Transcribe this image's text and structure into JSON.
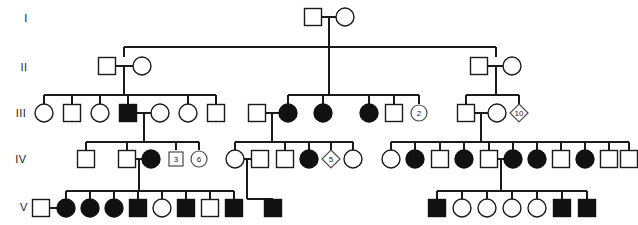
{
  "figure": {
    "type": "pedigree-chart",
    "width": 638,
    "height": 225,
    "background_color": "#ffffff",
    "line_color": "#1a1a1a",
    "affected_color": "#111111",
    "unaffected_color": "#ffffff"
  },
  "generation_labels": [
    {
      "label": "I",
      "x": 26,
      "y": 22
    },
    {
      "label": "II",
      "x": 24,
      "y": 71
    },
    {
      "label": "III",
      "x": 21,
      "y": 117
    },
    {
      "label": "IV",
      "x": 21,
      "y": 163
    },
    {
      "label": "V",
      "x": 24,
      "y": 211
    }
  ],
  "generations": [
    {
      "id": "I",
      "row_y": 17,
      "individuals": [
        {
          "id": "I-1",
          "shape": "square",
          "status": "unaffected",
          "x": 313,
          "label": ""
        },
        {
          "id": "I-2",
          "shape": "circle",
          "status": "unaffected",
          "x": 345,
          "label": ""
        }
      ]
    },
    {
      "id": "II",
      "row_y": 66,
      "individuals": [
        {
          "id": "II-1",
          "shape": "square",
          "status": "unaffected",
          "x": 107,
          "label": ""
        },
        {
          "id": "II-2",
          "shape": "circle",
          "status": "unaffected",
          "x": 142,
          "label": ""
        },
        {
          "id": "II-3",
          "shape": "square",
          "status": "unaffected",
          "x": 479,
          "label": ""
        },
        {
          "id": "II-4",
          "shape": "circle",
          "status": "unaffected",
          "x": 512,
          "label": ""
        }
      ]
    },
    {
      "id": "III",
      "row_y": 113,
      "individuals": [
        {
          "id": "III-1",
          "shape": "circle",
          "status": "unaffected",
          "x": 44,
          "label": ""
        },
        {
          "id": "III-2",
          "shape": "square",
          "status": "unaffected",
          "x": 72,
          "label": ""
        },
        {
          "id": "III-3",
          "shape": "circle",
          "status": "unaffected",
          "x": 100,
          "label": ""
        },
        {
          "id": "III-4",
          "shape": "square",
          "status": "affected",
          "x": 128,
          "label": ""
        },
        {
          "id": "III-5",
          "shape": "circle",
          "status": "unaffected",
          "x": 160,
          "label": ""
        },
        {
          "id": "III-6",
          "shape": "circle",
          "status": "unaffected",
          "x": 188,
          "label": ""
        },
        {
          "id": "III-7",
          "shape": "square",
          "status": "unaffected",
          "x": 216,
          "label": ""
        },
        {
          "id": "III-8",
          "shape": "square",
          "status": "unaffected",
          "x": 257,
          "label": ""
        },
        {
          "id": "III-9",
          "shape": "circle",
          "status": "affected",
          "x": 288,
          "label": ""
        },
        {
          "id": "III-10",
          "shape": "circle",
          "status": "affected",
          "x": 323,
          "label": ""
        },
        {
          "id": "III-11",
          "shape": "circle",
          "status": "affected",
          "x": 369,
          "label": ""
        },
        {
          "id": "III-12",
          "shape": "square",
          "status": "unaffected",
          "x": 394,
          "label": ""
        },
        {
          "id": "III-13",
          "shape": "circle",
          "status": "multiple",
          "x": 419,
          "label": "2"
        },
        {
          "id": "III-14",
          "shape": "square",
          "status": "unaffected",
          "x": 466,
          "label": ""
        },
        {
          "id": "III-15",
          "shape": "circle",
          "status": "unaffected",
          "x": 497,
          "label": ""
        },
        {
          "id": "III-16",
          "shape": "diamond",
          "status": "multiple",
          "x": 519,
          "label": "10"
        }
      ]
    },
    {
      "id": "IV",
      "row_y": 159,
      "individuals": [
        {
          "id": "IV-1",
          "shape": "square",
          "status": "unaffected",
          "x": 86,
          "label": ""
        },
        {
          "id": "IV-2",
          "shape": "square",
          "status": "unaffected",
          "x": 127,
          "label": ""
        },
        {
          "id": "IV-3",
          "shape": "circle",
          "status": "affected",
          "x": 151,
          "label": ""
        },
        {
          "id": "IV-4",
          "shape": "square",
          "status": "multiple",
          "x": 176,
          "label": "3"
        },
        {
          "id": "IV-5",
          "shape": "circle",
          "status": "multiple",
          "x": 199,
          "label": "6"
        },
        {
          "id": "IV-6",
          "shape": "circle",
          "status": "unaffected",
          "x": 235,
          "label": ""
        },
        {
          "id": "IV-7",
          "shape": "square",
          "status": "unaffected",
          "x": 260,
          "label": ""
        },
        {
          "id": "IV-8",
          "shape": "square",
          "status": "unaffected",
          "x": 285,
          "label": ""
        },
        {
          "id": "IV-9",
          "shape": "circle",
          "status": "affected",
          "x": 309,
          "label": ""
        },
        {
          "id": "IV-10",
          "shape": "diamond",
          "status": "multiple",
          "x": 331,
          "label": "5"
        },
        {
          "id": "IV-11",
          "shape": "circle",
          "status": "unaffected",
          "x": 353,
          "label": ""
        },
        {
          "id": "IV-12",
          "shape": "circle",
          "status": "unaffected",
          "x": 391,
          "label": ""
        },
        {
          "id": "IV-13",
          "shape": "circle",
          "status": "affected",
          "x": 415,
          "label": ""
        },
        {
          "id": "IV-14",
          "shape": "square",
          "status": "unaffected",
          "x": 440,
          "label": ""
        },
        {
          "id": "IV-15",
          "shape": "circle",
          "status": "affected",
          "x": 464,
          "label": ""
        },
        {
          "id": "IV-16",
          "shape": "square",
          "status": "unaffected",
          "x": 489,
          "label": ""
        },
        {
          "id": "IV-17",
          "shape": "circle",
          "status": "affected",
          "x": 513,
          "label": ""
        },
        {
          "id": "IV-18",
          "shape": "circle",
          "status": "affected",
          "x": 537,
          "label": ""
        },
        {
          "id": "IV-19",
          "shape": "square",
          "status": "unaffected",
          "x": 561,
          "label": ""
        },
        {
          "id": "IV-20",
          "shape": "circle",
          "status": "affected",
          "x": 585,
          "label": ""
        },
        {
          "id": "IV-21",
          "shape": "square",
          "status": "unaffected",
          "x": 609,
          "label": ""
        },
        {
          "id": "IV-22",
          "shape": "square",
          "status": "unaffected",
          "x": 629,
          "label": ""
        }
      ]
    },
    {
      "id": "V",
      "row_y": 208,
      "individuals": [
        {
          "id": "V-1",
          "shape": "square",
          "status": "unaffected",
          "x": 41,
          "label": ""
        },
        {
          "id": "V-2",
          "shape": "circle",
          "status": "affected",
          "x": 66,
          "label": ""
        },
        {
          "id": "V-3",
          "shape": "circle",
          "status": "affected",
          "x": 90,
          "label": ""
        },
        {
          "id": "V-4",
          "shape": "circle",
          "status": "affected",
          "x": 114,
          "label": ""
        },
        {
          "id": "V-5",
          "shape": "square",
          "status": "affected",
          "x": 138,
          "label": ""
        },
        {
          "id": "V-6",
          "shape": "circle",
          "status": "unaffected",
          "x": 162,
          "label": ""
        },
        {
          "id": "V-7",
          "shape": "square",
          "status": "affected",
          "x": 186,
          "label": ""
        },
        {
          "id": "V-8",
          "shape": "square",
          "status": "unaffected",
          "x": 210,
          "label": ""
        },
        {
          "id": "V-9",
          "shape": "square",
          "status": "affected",
          "x": 234,
          "label": ""
        },
        {
          "id": "V-10",
          "shape": "square",
          "status": "affected",
          "x": 273,
          "label": ""
        },
        {
          "id": "V-11",
          "shape": "square",
          "status": "affected",
          "x": 437,
          "label": ""
        },
        {
          "id": "V-12",
          "shape": "circle",
          "status": "unaffected",
          "x": 462,
          "label": ""
        },
        {
          "id": "V-13",
          "shape": "circle",
          "status": "unaffected",
          "x": 487,
          "label": ""
        },
        {
          "id": "V-14",
          "shape": "circle",
          "status": "unaffected",
          "x": 512,
          "label": ""
        },
        {
          "id": "V-15",
          "shape": "circle",
          "status": "unaffected",
          "x": 537,
          "label": ""
        },
        {
          "id": "V-16",
          "shape": "square",
          "status": "affected",
          "x": 562,
          "label": ""
        },
        {
          "id": "V-17",
          "shape": "square",
          "status": "affected",
          "x": 587,
          "label": ""
        }
      ]
    }
  ],
  "matings": [
    {
      "id": "mate-I-1-2",
      "x1": 313,
      "x2": 345,
      "y": 17
    },
    {
      "id": "mate-II-1-2",
      "x1": 107,
      "x2": 142,
      "y": 66
    },
    {
      "id": "mate-II-3-4",
      "x1": 479,
      "x2": 512,
      "y": 66
    },
    {
      "id": "mate-III-4-5",
      "x1": 128,
      "x2": 160,
      "y": 113
    },
    {
      "id": "mate-III-8-9",
      "x1": 257,
      "x2": 288,
      "y": 113
    },
    {
      "id": "mate-III-14-15",
      "x1": 466,
      "x2": 497,
      "y": 113
    },
    {
      "id": "mate-IV-2-3",
      "x1": 127,
      "x2": 151,
      "y": 159
    },
    {
      "id": "mate-IV-6-7",
      "x1": 235,
      "x2": 260,
      "y": 159
    },
    {
      "id": "mate-IV-16-17",
      "x1": 489,
      "x2": 513,
      "y": 159
    },
    {
      "id": "mate-V-1-2",
      "x1": 41,
      "x2": 66,
      "y": 208
    }
  ],
  "sibships": [
    {
      "id": "sibship-I-to-II",
      "drop_x": 329,
      "drop_y": 17,
      "bar_y": 47,
      "children_x": [
        124,
        496
      ],
      "child_top_y": 57
    },
    {
      "id": "sibship-II-left-to-III",
      "drop_x": 124,
      "drop_y": 66,
      "bar_y": 95,
      "children_x": [
        44,
        72,
        100,
        128,
        188,
        216
      ],
      "child_top_y": 104
    },
    {
      "id": "sibship-II-right-to-III",
      "drop_x": 496,
      "drop_y": 66,
      "bar_y": 95,
      "children_x": [
        466,
        519
      ],
      "child_top_y": 104
    },
    {
      "id": "sibship-III-mid-to-III-sibs",
      "drop_x": 329,
      "drop_y": 47,
      "bar_y": 95,
      "children_x": [
        288,
        323,
        369,
        394,
        419
      ],
      "child_top_y": 104
    },
    {
      "id": "sibship-III-4-5-to-IV",
      "drop_x": 144,
      "drop_y": 113,
      "bar_y": 142,
      "children_x": [
        86,
        127,
        176,
        199
      ],
      "child_top_y": 150
    },
    {
      "id": "sibship-III-8-9-to-IV",
      "drop_x": 272,
      "drop_y": 113,
      "bar_y": 142,
      "children_x": [
        235,
        285,
        309,
        331,
        353
      ],
      "child_top_y": 150
    },
    {
      "id": "sibship-III-14-15-to-IV",
      "drop_x": 481,
      "drop_y": 113,
      "bar_y": 142,
      "children_x": [
        391,
        415,
        440,
        464,
        489,
        513,
        537,
        561,
        585,
        609,
        629
      ],
      "child_top_y": 150
    },
    {
      "id": "sibship-IV-2-3-to-V",
      "drop_x": 139,
      "drop_y": 159,
      "bar_y": 191,
      "children_x": [
        66,
        90,
        114,
        138,
        162,
        186,
        210,
        234
      ],
      "child_top_y": 199
    },
    {
      "id": "sibship-IV-6-7-to-V",
      "drop_x": 247,
      "drop_y": 159,
      "bar_y": 199,
      "children_x": [
        273
      ],
      "child_top_y": 199
    },
    {
      "id": "sibship-IV-16-17-to-V",
      "drop_x": 501,
      "drop_y": 159,
      "bar_y": 191,
      "children_x": [
        437,
        462,
        487,
        512,
        537,
        562,
        587
      ],
      "child_top_y": 199
    }
  ],
  "symbol_sizes": {
    "square_side": 17,
    "circle_radius": 9,
    "diamond_half": 10,
    "multi_square_side": 14,
    "multi_circle_radius": 8,
    "multi_diamond_half": 9
  }
}
